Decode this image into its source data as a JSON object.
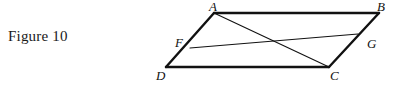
{
  "figure": {
    "caption": "Figure 10",
    "type": "geometry-diagram",
    "shape": "parallelogram",
    "background_color": "#ffffff",
    "stroke_color": "#111111",
    "outline_stroke_width": 2.4,
    "inner_stroke_width": 1.1,
    "canvas": {
      "width": 393,
      "height": 90
    },
    "points": {
      "A": {
        "x": 214,
        "y": 13,
        "label": "A",
        "label_x": 209,
        "label_y": 0
      },
      "B": {
        "x": 379,
        "y": 13,
        "label": "B",
        "label_x": 377,
        "label_y": 0
      },
      "C": {
        "x": 329,
        "y": 67,
        "label": "C",
        "label_x": 330,
        "label_y": 69
      },
      "D": {
        "x": 166,
        "y": 67,
        "label": "D",
        "label_x": 156,
        "label_y": 69
      },
      "F": {
        "x": 190,
        "y": 48,
        "label": "F",
        "label_x": 175,
        "label_y": 36
      },
      "G": {
        "x": 358,
        "y": 34,
        "label": "G",
        "label_x": 367,
        "label_y": 37
      }
    },
    "outline_edges": [
      {
        "name": "edge-AB",
        "from": "A",
        "to": "B"
      },
      {
        "name": "edge-BC",
        "from": "B",
        "to": "C"
      },
      {
        "name": "edge-CD",
        "from": "C",
        "to": "D"
      },
      {
        "name": "edge-DA",
        "from": "D",
        "to": "A"
      }
    ],
    "inner_segments": [
      {
        "name": "segment-AC",
        "from": "A",
        "to": "C"
      },
      {
        "name": "segment-FG",
        "from": "F",
        "to": "G"
      }
    ]
  }
}
